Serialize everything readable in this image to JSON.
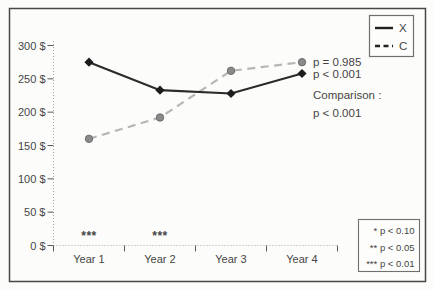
{
  "figure": {
    "background": "#fcfcfa",
    "border_color": "#474747",
    "text_color": "#454545"
  },
  "chart_data": {
    "type": "line",
    "categories": [
      "Year 1",
      "Year 2",
      "Year 3",
      "Year 4"
    ],
    "series": [
      {
        "name": "C",
        "line_style": "dashed",
        "line_color": "#b6b6b6",
        "marker": "circle",
        "marker_fill": "#8a8a8a",
        "marker_stroke": "#6b6b6b",
        "values": [
          160,
          192,
          262,
          275
        ],
        "endpoint_label": "p = 0.985"
      },
      {
        "name": "X",
        "line_style": "solid",
        "line_color": "#2b2b2b",
        "marker": "diamond",
        "marker_fill": "#1c1c1c",
        "marker_stroke": "#1c1c1c",
        "values": [
          275,
          233,
          228,
          258
        ],
        "endpoint_label": "p < 0.001"
      }
    ],
    "ylim": [
      0,
      300
    ],
    "grid": false,
    "y_ticks": [
      {
        "value": 300,
        "label": "300 $"
      },
      {
        "value": 250,
        "label": "250 $"
      },
      {
        "value": 200,
        "label": "200 $"
      },
      {
        "value": 150,
        "label": "150 $"
      },
      {
        "value": 100,
        "label": "100 $"
      },
      {
        "value": 50,
        "label": "50 $"
      },
      {
        "value": 0,
        "label": "0 $"
      }
    ],
    "legend": {
      "position": "top-right",
      "entries": [
        {
          "label": "X",
          "style": "solid"
        },
        {
          "label": "C",
          "style": "dashed"
        }
      ]
    },
    "annotations": {
      "comparison_title": "Comparison :",
      "comparison_value": "p < 0.001",
      "significance_markers": [
        {
          "category_index": 0,
          "text": "***"
        },
        {
          "category_index": 1,
          "text": "***"
        }
      ]
    },
    "footnote_box": [
      "* p < 0.10",
      "** p < 0.05",
      "*** p < 0.01"
    ]
  }
}
